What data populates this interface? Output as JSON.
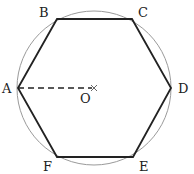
{
  "figure": {
    "type": "regular hexagon inscribed in a circle",
    "center": {
      "label": "O",
      "x": 94,
      "y": 88
    },
    "circle": {
      "cx": 94,
      "cy": 88,
      "r": 77,
      "stroke": "#9a9a9a"
    },
    "hexagon_stroke": "#222222",
    "vertices": [
      {
        "label": "A",
        "x": 18,
        "y": 88,
        "lx": 2,
        "ly": 93
      },
      {
        "label": "B",
        "x": 57,
        "y": 19,
        "lx": 39,
        "ly": 17
      },
      {
        "label": "C",
        "x": 132,
        "y": 19,
        "lx": 138,
        "ly": 17
      },
      {
        "label": "D",
        "x": 171,
        "y": 88,
        "lx": 178,
        "ly": 93
      },
      {
        "label": "E",
        "x": 133,
        "y": 157,
        "lx": 139,
        "ly": 171
      },
      {
        "label": "F",
        "x": 57,
        "y": 157,
        "lx": 43,
        "ly": 171
      }
    ],
    "radius_segment": {
      "from": "A",
      "to": "O",
      "style": "dashed"
    },
    "center_mark": "×",
    "labels": {
      "A": "A",
      "B": "B",
      "C": "C",
      "D": "D",
      "E": "E",
      "F": "F",
      "O": "O"
    }
  }
}
